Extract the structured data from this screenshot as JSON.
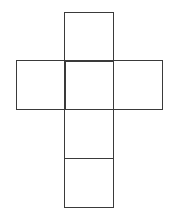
{
  "diagram": {
    "type": "cube-net",
    "shape": "cross",
    "stroke_color": "#3a3a3a",
    "background": "#ffffff",
    "face_size_px": 49,
    "faces": [
      {
        "name": "top",
        "col": 1,
        "row": 0,
        "x": 64,
        "y": 12
      },
      {
        "name": "left",
        "col": 0,
        "row": 1,
        "x": 16,
        "y": 60
      },
      {
        "name": "center",
        "col": 1,
        "row": 1,
        "x": 64,
        "y": 60
      },
      {
        "name": "right",
        "col": 2,
        "row": 1,
        "x": 113,
        "y": 60
      },
      {
        "name": "lower",
        "col": 1,
        "row": 2,
        "x": 64,
        "y": 109
      },
      {
        "name": "bottom",
        "col": 1,
        "row": 3,
        "x": 64,
        "y": 158
      }
    ]
  }
}
